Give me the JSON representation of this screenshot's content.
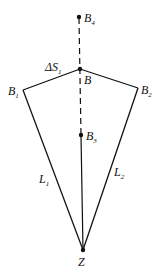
{
  "diagram": {
    "points": {
      "B4": {
        "label": "B",
        "sub": "4"
      },
      "B": {
        "label": "B",
        "sub": ""
      },
      "B1": {
        "label": "B",
        "sub": "1"
      },
      "B2": {
        "label": "B",
        "sub": "2"
      },
      "B3": {
        "label": "B",
        "sub": "3"
      },
      "Z": {
        "label": "Z",
        "sub": ""
      }
    },
    "edges": {
      "L1": {
        "label": "L",
        "sub": "1"
      },
      "L2": {
        "label": "L",
        "sub": "2"
      },
      "dS1": {
        "label": "ΔS",
        "sub": "1"
      }
    },
    "color": "#111111"
  }
}
